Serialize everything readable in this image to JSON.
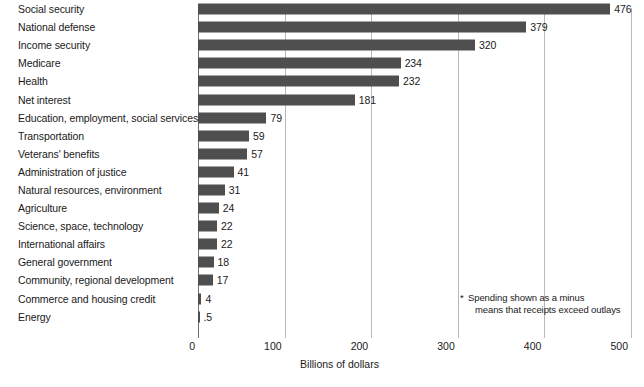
{
  "chart_data": {
    "type": "bar",
    "orientation": "horizontal",
    "title": "",
    "xlabel": "Billions of dollars",
    "ylabel": "",
    "xlim": [
      0,
      500
    ],
    "xticks": [
      0,
      100,
      200,
      300,
      400,
      500
    ],
    "xtick_labels": [
      "0",
      "100",
      "200",
      "300",
      "400",
      "500"
    ],
    "grid": "vertical",
    "legend": "none",
    "bar_color": "#4e4e4e",
    "gridline_color": "#b9b9b9",
    "axis_color": "#6f6f6f",
    "categories": [
      "Social security",
      "National defense",
      "Income security",
      "Medicare",
      "Health",
      "Net interest",
      "Education, employment, social services",
      "Transportation",
      "Veterans' benefits",
      "Administration of justice",
      "Natural resources, environment",
      "Agriculture",
      "Science, space, technology",
      "International affairs",
      "General government",
      "Community, regional development",
      "Commerce and housing credit",
      "Energy"
    ],
    "values": [
      476,
      379,
      320,
      234,
      232,
      181,
      79,
      59,
      57,
      41,
      31,
      24,
      22,
      22,
      18,
      17,
      4,
      0.5
    ],
    "value_labels": [
      "476",
      "379",
      "320",
      "234",
      "232",
      "181",
      "79",
      "59",
      "57",
      "41",
      "31",
      "24",
      "22",
      "22",
      "18",
      "17",
      "4",
      ".5"
    ],
    "annotations": [
      {
        "marker": "*",
        "line1": "Spending shown as a minus",
        "line2": "means that receipts exceed outlays"
      }
    ]
  }
}
